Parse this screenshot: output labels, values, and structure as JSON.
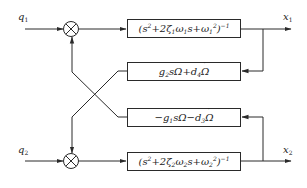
{
  "diagram": {
    "type": "block-diagram",
    "inputs": [
      {
        "id": "q1",
        "symbol": "q",
        "subscript": "1"
      },
      {
        "id": "q2",
        "symbol": "q",
        "subscript": "2"
      }
    ],
    "outputs": [
      {
        "id": "x1",
        "symbol": "x",
        "subscript": "1"
      },
      {
        "id": "x2",
        "symbol": "x",
        "subscript": "2"
      }
    ],
    "summing_junctions": [
      {
        "id": "sum1",
        "symbol": "⊗"
      },
      {
        "id": "sum2",
        "symbol": "⊗"
      }
    ],
    "blocks": [
      {
        "id": "plant1",
        "expression": "(s² + 2ζ₁ω₁s + ω₁²)⁻¹"
      },
      {
        "id": "coupling2",
        "expression": "g₂sΩ + d₄Ω̇"
      },
      {
        "id": "coupling1",
        "expression": "−g₁sΩ − d₃Ω̇"
      },
      {
        "id": "plant2",
        "expression": "(s² + 2ζ₂ω₂s + ω₂²)⁻¹"
      }
    ],
    "connections": [
      "q1 → sum1",
      "sum1 → plant1",
      "plant1 → x1",
      "x1 → coupling2",
      "coupling2 → sum2",
      "q2 → sum2",
      "sum2 → plant2",
      "plant2 → x2",
      "x2 → coupling1",
      "coupling1 → sum1"
    ],
    "colors": {
      "line": "#2a2a2a",
      "background": "#ffffff"
    }
  }
}
